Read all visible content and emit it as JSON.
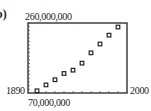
{
  "part_label": "b)",
  "chart_data": {
    "type": "scatter",
    "title": "",
    "xlabel": "",
    "ylabel": "",
    "window": {
      "xmin_label": "1890",
      "xmax_label": "2000",
      "ymin_label": "70,000,000",
      "ymax_label": "260,000,000"
    },
    "xlim": [
      1890,
      2000
    ],
    "ylim": [
      70000000,
      260000000
    ],
    "grid": false,
    "legend": "none",
    "x": [
      1900,
      1910,
      1920,
      1930,
      1940,
      1950,
      1960,
      1970,
      1980,
      1990
    ],
    "y": [
      76000000,
      92000000,
      106000000,
      123000000,
      132000000,
      151000000,
      179000000,
      203000000,
      227000000,
      249000000
    ],
    "marker": "hollow-square",
    "axis_ticks": {
      "x_step": 10,
      "y_step": 10000000
    }
  }
}
